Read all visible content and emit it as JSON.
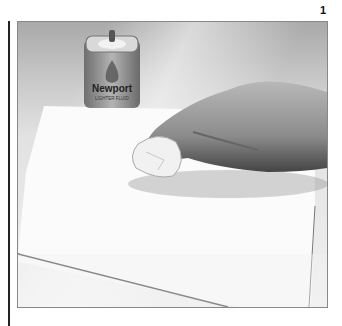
{
  "page": {
    "number": "1"
  },
  "illustration": {
    "subject": "hand-rubbing-paper-with-cloth",
    "can_label": {
      "brand": "Newport",
      "product": "LIGHTER FLUID"
    }
  },
  "colors": {
    "background": "#ffffff",
    "backdrop_dark": "#a9a9a9",
    "paper": "#fbfbfb",
    "can_body": "#8a8a8a",
    "skin_tone": "#9a9a9a",
    "rule": "#222222"
  }
}
